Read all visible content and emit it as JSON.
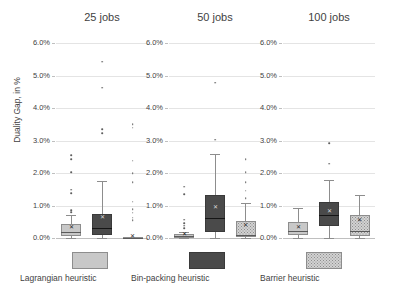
{
  "chart_data": {
    "type": "box",
    "title": "",
    "xlabel": "",
    "ylabel": "Duality Gap, in %",
    "ylim": [
      0.0,
      6.0
    ],
    "ytick_labels": [
      "0.0%",
      "1.0%",
      "2.0%",
      "3.0%",
      "4.0%",
      "5.0%",
      "6.0%"
    ],
    "ytick_values": [
      0.0,
      1.0,
      2.0,
      3.0,
      4.0,
      5.0,
      6.0
    ],
    "grid": true,
    "legend_position": "bottom",
    "series": [
      {
        "name": "Lagrangian heuristic",
        "color": "#c8c8c8",
        "fill": "solid"
      },
      {
        "name": "Bin-packing heuristic",
        "color": "#4a4a4a",
        "fill": "solid"
      },
      {
        "name": "Barrier heuristic",
        "color": "#d2d2d2",
        "fill": "dotted"
      }
    ],
    "panels": [
      {
        "title": "25 jobs",
        "boxes": [
          {
            "series": "Lagrangian heuristic",
            "whisker_low": 0.0,
            "q1": 0.05,
            "median": 0.18,
            "q3": 0.42,
            "whisker_high": 0.72,
            "mean": 0.3,
            "outliers": [
              0.8,
              0.86,
              1.38,
              1.48,
              2.03,
              2.42,
              2.55
            ]
          },
          {
            "series": "Bin-packing heuristic",
            "whisker_low": 0.0,
            "q1": 0.08,
            "median": 0.3,
            "q3": 0.75,
            "whisker_high": 1.76,
            "mean": 0.62,
            "outliers": [
              3.22,
              3.34,
              4.62,
              5.43
            ]
          },
          {
            "series": "Barrier heuristic",
            "whisker_low": 0.0,
            "q1": 0.0,
            "median": 0.0,
            "q3": 0.02,
            "whisker_high": 0.03,
            "mean": 0.02,
            "outliers": [
              0.55,
              0.62,
              0.78,
              0.88,
              1.12,
              1.72,
              2.0,
              2.38,
              3.4,
              3.5
            ]
          }
        ]
      },
      {
        "title": "50 jobs",
        "boxes": [
          {
            "series": "Lagrangian heuristic",
            "whisker_low": 0.0,
            "q1": 0.0,
            "median": 0.05,
            "q3": 0.12,
            "whisker_high": 0.2,
            "mean": 0.1,
            "outliers": [
              0.3,
              0.38,
              0.46,
              0.56,
              1.35,
              1.58
            ]
          },
          {
            "series": "Bin-packing heuristic",
            "whisker_low": 0.0,
            "q1": 0.18,
            "median": 0.62,
            "q3": 1.32,
            "whisker_high": 2.6,
            "mean": 0.92,
            "outliers": [
              3.02,
              4.78
            ]
          },
          {
            "series": "Barrier heuristic",
            "whisker_low": 0.0,
            "q1": 0.02,
            "median": 0.1,
            "q3": 0.52,
            "whisker_high": 1.08,
            "mean": 0.38,
            "outliers": [
              1.22,
              1.45,
              1.72,
              2.02,
              2.42
            ]
          }
        ]
      },
      {
        "title": "100 jobs",
        "boxes": [
          {
            "series": "Lagrangian heuristic",
            "whisker_low": 0.0,
            "q1": 0.1,
            "median": 0.22,
            "q3": 0.48,
            "whisker_high": 0.92,
            "mean": 0.32,
            "outliers": []
          },
          {
            "series": "Bin-packing heuristic",
            "whisker_low": 0.0,
            "q1": 0.38,
            "median": 0.72,
            "q3": 1.12,
            "whisker_high": 1.78,
            "mean": 0.8,
            "outliers": [
              2.28,
              2.92
            ]
          },
          {
            "series": "Barrier heuristic",
            "whisker_low": 0.0,
            "q1": 0.05,
            "median": 0.22,
            "q3": 0.72,
            "whisker_high": 1.32,
            "mean": 0.52,
            "outliers": []
          }
        ]
      }
    ]
  },
  "legend": {
    "items": [
      {
        "label": "Lagrangian heuristic"
      },
      {
        "label": "Bin-packing heuristic"
      },
      {
        "label": "Barrier heuristic"
      }
    ]
  }
}
